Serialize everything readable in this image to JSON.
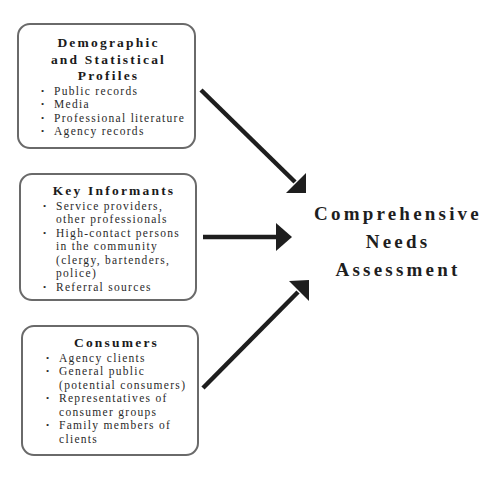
{
  "diagram": {
    "type": "flow",
    "sources": [
      {
        "title_lines": [
          "Demographic",
          "and Statistical",
          "Profiles"
        ],
        "items": [
          [
            "Public records"
          ],
          [
            "Media"
          ],
          [
            "Professional literature"
          ],
          [
            "Agency records"
          ]
        ]
      },
      {
        "title_lines": [
          "Key Informants"
        ],
        "items": [
          [
            "Service providers,",
            "other professionals"
          ],
          [
            "High-contact persons",
            "in the community",
            "(clergy, bartenders,",
            "police)"
          ],
          [
            "Referral sources"
          ]
        ]
      },
      {
        "title_lines": [
          "Consumers"
        ],
        "items": [
          [
            "Agency clients"
          ],
          [
            "General public",
            "(potential consumers)"
          ],
          [
            "Representatives of",
            "consumer groups"
          ],
          [
            "Family members of",
            "clients"
          ]
        ]
      }
    ],
    "target": {
      "lines": [
        "Comprehensive",
        "Needs",
        "Assessment"
      ]
    },
    "colors": {
      "box_border": "#6a6a6a",
      "arrow": "#1e1e1e",
      "text": "#1e1e1e",
      "background": "#ffffff"
    }
  }
}
